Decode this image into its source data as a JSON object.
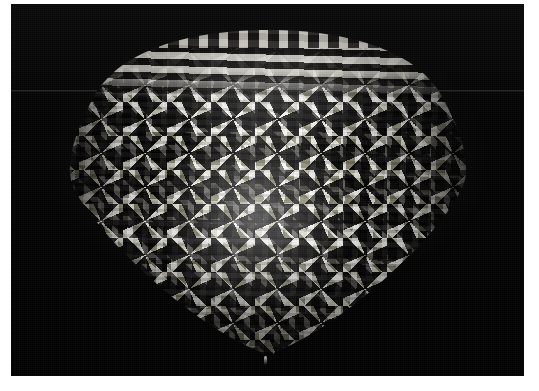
{
  "image": {
    "kind": "photograph",
    "medium": "black and white photographic print",
    "title": "Conical plaited basket",
    "caption": "Black-and-white photograph of a cone-shaped woven basket with a light-and-dark plaited diamond pattern, photographed against a plain black background.",
    "orientation": "landscape",
    "width_px": 539,
    "height_px": 391
  },
  "print": {
    "border_label": "white photographic print border",
    "border_color": "#ffffff",
    "border_left_px": 11,
    "border_top_px": 4,
    "border_right_px": 15,
    "border_bottom_px": 15
  },
  "background": {
    "label": "black studio backdrop",
    "color": "#050505",
    "seam_label": "faint horizontal backdrop seam",
    "seam_color": "#969696"
  },
  "subject": {
    "name": "conical woven basket",
    "shape": "inverted cone with rounded dome rim, tapering to a point at the bottom",
    "technique": "twill plaiting with flat splints",
    "colors": {
      "light_splint": "#eee9dc",
      "dark_splint": "#141311",
      "highlight": "#ffffff",
      "shadow": "#000000"
    },
    "parts": {
      "rim_label": "banded top rim",
      "selvedge_label": "looped top selvedge",
      "body_label": "plaited body with diamond motifs",
      "tip_label": "bottom point",
      "sheen_label": "specular highlight"
    }
  }
}
